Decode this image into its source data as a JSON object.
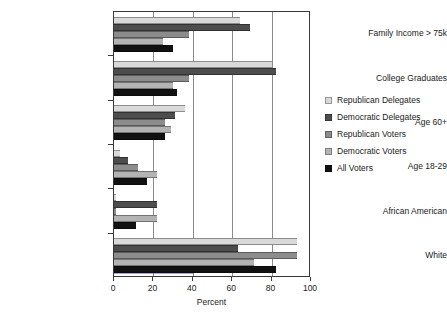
{
  "chart_data": {
    "type": "bar",
    "orientation": "horizontal",
    "title": "",
    "xlabel": "Percent",
    "ylabel": "",
    "xlim": [
      0,
      100
    ],
    "xticks": [
      0,
      20,
      40,
      60,
      80,
      100
    ],
    "grid": "vertical",
    "legend_position": "right",
    "categories": [
      "Family Income > 75k",
      "College Graduates",
      "Age 60+",
      "Age 18-29",
      "African American",
      "White"
    ],
    "series": [
      {
        "name": "Republican Delegates",
        "color": "#d9d9d9",
        "values": [
          64,
          80,
          36,
          3,
          1,
          93
        ]
      },
      {
        "name": "Democratic Delegates",
        "color": "#4d4d4d",
        "values": [
          69,
          82,
          31,
          7,
          22,
          63
        ]
      },
      {
        "name": "Republican Voters",
        "color": "#8c8c8c",
        "values": [
          38,
          38,
          26,
          12,
          1,
          93
        ]
      },
      {
        "name": "Democratic Voters",
        "color": "#b3b3b3",
        "values": [
          25,
          30,
          29,
          22,
          22,
          71
        ]
      },
      {
        "name": "All Voters",
        "color": "#111111",
        "values": [
          30,
          32,
          26,
          17,
          11,
          82
        ]
      }
    ]
  },
  "axis": {
    "x_title": "Percent",
    "tick_labels": [
      "0",
      "20",
      "40",
      "60",
      "80",
      "100"
    ]
  },
  "legend": {
    "entries": [
      "Republican Delegates",
      "Democratic Delegates",
      "Republican Voters",
      "Democratic Voters",
      "All Voters"
    ]
  }
}
